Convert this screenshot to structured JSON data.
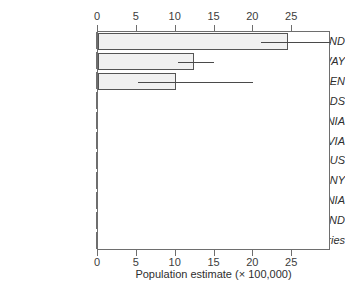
{
  "chart_data": {
    "type": "bar",
    "orientation": "horizontal",
    "title": "",
    "xlabel": "Population estimate (× 100,000)",
    "ylabel": "",
    "xlim": [
      0,
      30
    ],
    "xticks": [
      0,
      5,
      10,
      15,
      20,
      25
    ],
    "xtick_labels": [
      "0",
      "5",
      "10",
      "15",
      "20",
      "25"
    ],
    "grid": false,
    "legend": null,
    "axis_duplicated_top": true,
    "categories": [
      "FINLAND",
      "NORWAY",
      "SWEDEN",
      "NETHERLANDS",
      "ESTONIA",
      "LATVIA",
      "BELARUS",
      "GERMANY",
      "LITHUANIA",
      "ICELAND",
      "Other countries"
    ],
    "values": [
      24.5,
      12.3,
      10.0,
      0,
      0,
      0,
      0,
      0,
      0,
      0,
      0
    ],
    "error_bars": [
      {
        "category": "FINLAND",
        "low": 21.0,
        "high": 30.0,
        "clipped_right": true
      },
      {
        "category": "NORWAY",
        "low": 10.3,
        "high": 15.0,
        "clipped_right": false
      },
      {
        "category": "SWEDEN",
        "low": 5.2,
        "high": 20.0,
        "clipped_right": false
      },
      {
        "category": "NETHERLANDS",
        "low": 0,
        "high": 0,
        "clipped_right": false
      },
      {
        "category": "ESTONIA",
        "low": 0,
        "high": 0,
        "clipped_right": false
      },
      {
        "category": "LATVIA",
        "low": 0,
        "high": 0,
        "clipped_right": false
      },
      {
        "category": "BELARUS",
        "low": 0,
        "high": 0,
        "clipped_right": false
      },
      {
        "category": "GERMANY",
        "low": 0,
        "high": 0,
        "clipped_right": false
      },
      {
        "category": "LITHUANIA",
        "low": 0,
        "high": 0,
        "clipped_right": false
      },
      {
        "category": "ICELAND",
        "low": 0,
        "high": 0,
        "clipped_right": false
      },
      {
        "category": "Other countries",
        "low": 0,
        "high": 0,
        "clipped_right": false
      }
    ],
    "colors": {
      "bar_fill": "#f1f1f1",
      "bar_edge": "#555555",
      "error_bar": "#4a4a4a",
      "axis": "#6e6e6e",
      "text": "#2e2e2e",
      "background": "#ffffff"
    }
  }
}
